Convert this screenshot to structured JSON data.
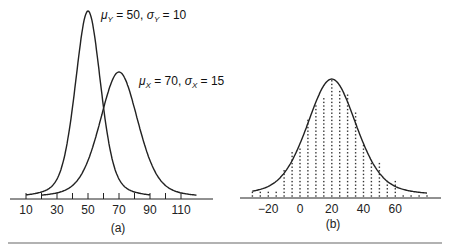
{
  "chart_data": [
    {
      "type": "line",
      "panel": "(a)",
      "title": "",
      "xlabel": "",
      "ylabel": "",
      "x_ticks": [
        10,
        20,
        30,
        40,
        50,
        60,
        70,
        80,
        90,
        100,
        110
      ],
      "x_tick_labels": [
        "10",
        "30",
        "50",
        "70",
        "90",
        "110"
      ],
      "xlim": [
        5,
        120
      ],
      "grid": false,
      "series": [
        {
          "name": "Y",
          "distribution": "normal",
          "mean": 50,
          "sd": 10,
          "x_range": [
            10,
            90
          ],
          "annotation": "μY = 50, σY = 10"
        },
        {
          "name": "X",
          "distribution": "normal",
          "mean": 70,
          "sd": 15,
          "x_range": [
            20,
            120
          ],
          "annotation": "μX = 70, σX = 15"
        }
      ]
    },
    {
      "type": "scatter",
      "panel": "(b)",
      "title": "",
      "xlabel": "",
      "ylabel": "",
      "x_tick_labels": [
        "-20",
        "0",
        "20",
        "40",
        "60"
      ],
      "xlim": [
        -35,
        90
      ],
      "grid": false,
      "curve": {
        "distribution": "normal",
        "mean": 20,
        "x_range": [
          -30,
          80
        ]
      },
      "dot_columns": {
        "x": [
          -30,
          -25,
          -20,
          -15,
          -10,
          -5,
          0,
          5,
          10,
          15,
          20,
          25,
          30,
          35,
          40,
          45,
          50,
          55,
          60,
          65,
          70,
          75,
          80
        ],
        "height_dots": [
          2,
          2,
          2,
          2,
          8,
          13,
          14,
          22,
          26,
          28,
          33,
          30,
          29,
          24,
          15,
          10,
          10,
          5,
          5,
          1,
          1,
          1,
          1
        ]
      }
    }
  ],
  "panels": {
    "a": {
      "caption": "(a)",
      "annotation_y": {
        "mu": "μ",
        "sub": "Y",
        "text1": " = 50, ",
        "sigma": "σ",
        "text2": " = 10"
      },
      "annotation_x": {
        "mu": "μ",
        "sub": "X",
        "text1": " = 70, ",
        "sigma": "σ",
        "text2": " = 15"
      }
    },
    "b": {
      "caption": "(b)"
    }
  }
}
